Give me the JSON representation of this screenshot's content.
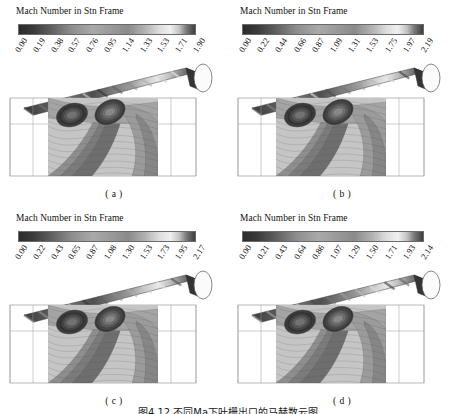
{
  "figure": {
    "caption": "图4.12 不同Ma下叶栅出口的马赫数云图",
    "colorbar_title": "Mach Number in Stn Frame"
  },
  "chart_data": {
    "type": "heatmap",
    "title": "Mach Number in Stn Frame",
    "xlabel": "",
    "ylabel": "",
    "colormap": "grayscale-rainbow",
    "panels": [
      {
        "id": "a",
        "label": "( a )",
        "colorbar_title": "Mach Number in Stn Frame",
        "ticks": [
          "0.00",
          "0.19",
          "0.38",
          "0.57",
          "0.76",
          "0.95",
          "1.14",
          "1.33",
          "1.53",
          "1.71",
          "1.90"
        ],
        "range": [
          0.0,
          1.9
        ],
        "quantity": "Mach Number in Stn Frame"
      },
      {
        "id": "b",
        "label": "( b )",
        "colorbar_title": "Mach Number in Stn Frame",
        "ticks": [
          "0.00",
          "0.22",
          "0.44",
          "0.66",
          "0.87",
          "1.09",
          "1.31",
          "1.53",
          "1.75",
          "1.97",
          "2.19"
        ],
        "range": [
          0.0,
          2.19
        ],
        "quantity": "Mach Number in Stn Frame"
      },
      {
        "id": "c",
        "label": "( c )",
        "colorbar_title": "Mach Number in Stn Frame",
        "ticks": [
          "0.00",
          "0.22",
          "0.43",
          "0.65",
          "0.87",
          "1.08",
          "1.30",
          "1.53",
          "1.73",
          "1.95",
          "2.17"
        ],
        "range": [
          0.0,
          2.17
        ],
        "quantity": "Mach Number in Stn Frame"
      },
      {
        "id": "d",
        "label": "( d )",
        "colorbar_title": "Mach Number in Stn Frame",
        "ticks": [
          "0.00",
          "0.21",
          "0.43",
          "0.64",
          "0.86",
          "1.07",
          "1.29",
          "1.50",
          "1.71",
          "1.93",
          "2.14"
        ],
        "range": [
          0.0,
          2.14
        ],
        "quantity": "Mach Number in Stn Frame"
      }
    ],
    "colorbar_stops": [
      {
        "pos": 0,
        "hex": "#2b2b2b"
      },
      {
        "pos": 8,
        "hex": "#3a3a3a"
      },
      {
        "pos": 18,
        "hex": "#5e5e5e"
      },
      {
        "pos": 30,
        "hex": "#8e8e8e"
      },
      {
        "pos": 42,
        "hex": "#a9a9a9"
      },
      {
        "pos": 52,
        "hex": "#9a9a9a"
      },
      {
        "pos": 62,
        "hex": "#8a8a8a"
      },
      {
        "pos": 72,
        "hex": "#b4b4b4"
      },
      {
        "pos": 80,
        "hex": "#dedede"
      },
      {
        "pos": 86,
        "hex": "#f0f0f0"
      },
      {
        "pos": 91,
        "hex": "#c4c4c4"
      },
      {
        "pos": 95,
        "hex": "#7a7a7a"
      },
      {
        "pos": 100,
        "hex": "#3d3d3d"
      }
    ]
  }
}
